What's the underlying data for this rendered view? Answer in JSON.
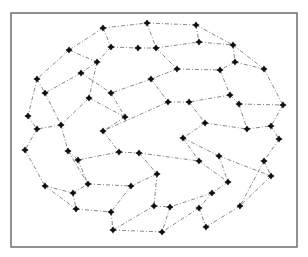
{
  "figure": {
    "frame": {
      "x": 11,
      "y": 13,
      "width": 286,
      "height": 234
    },
    "colors": {
      "frame": "#6e6e6e",
      "edge": "#7a7a7a",
      "node": "#111111",
      "background": "#ffffff"
    },
    "nodes": [
      [
        103,
        28
      ],
      [
        147,
        23
      ],
      [
        196,
        25
      ],
      [
        69,
        50
      ],
      [
        111,
        47
      ],
      [
        138,
        48
      ],
      [
        156,
        48
      ],
      [
        199,
        42
      ],
      [
        233,
        45
      ],
      [
        97,
        62
      ],
      [
        235,
        62
      ],
      [
        177,
        69
      ],
      [
        220,
        70
      ],
      [
        264,
        69
      ],
      [
        81,
        73
      ],
      [
        37,
        79
      ],
      [
        151,
        79
      ],
      [
        45,
        93
      ],
      [
        111,
        93
      ],
      [
        89,
        98
      ],
      [
        230,
        95
      ],
      [
        168,
        102
      ],
      [
        189,
        102
      ],
      [
        239,
        104
      ],
      [
        283,
        105
      ],
      [
        28,
        116
      ],
      [
        61,
        125
      ],
      [
        125,
        117
      ],
      [
        37,
        129
      ],
      [
        103,
        131
      ],
      [
        205,
        123
      ],
      [
        247,
        129
      ],
      [
        271,
        126
      ],
      [
        183,
        138
      ],
      [
        279,
        139
      ],
      [
        25,
        150
      ],
      [
        68,
        151
      ],
      [
        119,
        152
      ],
      [
        139,
        153
      ],
      [
        219,
        156
      ],
      [
        199,
        161
      ],
      [
        264,
        161
      ],
      [
        78,
        160
      ],
      [
        157,
        174
      ],
      [
        271,
        176
      ],
      [
        228,
        182
      ],
      [
        45,
        186
      ],
      [
        88,
        184
      ],
      [
        131,
        186
      ],
      [
        73,
        193
      ],
      [
        212,
        193
      ],
      [
        154,
        206
      ],
      [
        170,
        207
      ],
      [
        199,
        208
      ],
      [
        240,
        206
      ],
      [
        76,
        209
      ],
      [
        111,
        212
      ],
      [
        113,
        230
      ],
      [
        162,
        232
      ],
      [
        206,
        227
      ]
    ],
    "edges": [
      [
        0,
        1
      ],
      [
        1,
        2
      ],
      [
        0,
        3
      ],
      [
        0,
        4
      ],
      [
        4,
        5
      ],
      [
        5,
        6
      ],
      [
        1,
        6
      ],
      [
        6,
        7
      ],
      [
        2,
        7
      ],
      [
        2,
        8
      ],
      [
        7,
        8
      ],
      [
        3,
        9
      ],
      [
        4,
        9
      ],
      [
        8,
        10
      ],
      [
        8,
        13
      ],
      [
        10,
        12
      ],
      [
        10,
        13
      ],
      [
        11,
        12
      ],
      [
        6,
        11
      ],
      [
        11,
        16
      ],
      [
        3,
        15
      ],
      [
        9,
        19
      ],
      [
        9,
        14
      ],
      [
        14,
        17
      ],
      [
        14,
        18
      ],
      [
        15,
        17
      ],
      [
        15,
        25
      ],
      [
        16,
        18
      ],
      [
        16,
        21
      ],
      [
        12,
        20
      ],
      [
        20,
        22
      ],
      [
        20,
        23
      ],
      [
        21,
        22
      ],
      [
        13,
        24
      ],
      [
        23,
        24
      ],
      [
        17,
        26
      ],
      [
        19,
        26
      ],
      [
        18,
        27
      ],
      [
        19,
        27
      ],
      [
        25,
        28
      ],
      [
        26,
        28
      ],
      [
        27,
        29
      ],
      [
        21,
        29
      ],
      [
        22,
        30
      ],
      [
        23,
        31
      ],
      [
        24,
        32
      ],
      [
        31,
        32
      ],
      [
        30,
        31
      ],
      [
        30,
        33
      ],
      [
        29,
        37
      ],
      [
        32,
        34
      ],
      [
        34,
        41
      ],
      [
        33,
        39
      ],
      [
        33,
        40
      ],
      [
        39,
        44
      ],
      [
        41,
        44
      ],
      [
        28,
        35
      ],
      [
        26,
        36
      ],
      [
        36,
        42
      ],
      [
        35,
        46
      ],
      [
        36,
        47
      ],
      [
        37,
        38
      ],
      [
        38,
        40
      ],
      [
        37,
        42
      ],
      [
        38,
        43
      ],
      [
        43,
        48
      ],
      [
        47,
        48
      ],
      [
        42,
        47
      ],
      [
        46,
        49
      ],
      [
        49,
        47
      ],
      [
        46,
        55
      ],
      [
        49,
        55
      ],
      [
        40,
        45
      ],
      [
        45,
        50
      ],
      [
        39,
        45
      ],
      [
        44,
        54
      ],
      [
        43,
        51
      ],
      [
        50,
        52
      ],
      [
        50,
        53
      ],
      [
        51,
        52
      ],
      [
        52,
        58
      ],
      [
        48,
        56
      ],
      [
        55,
        56
      ],
      [
        56,
        57
      ],
      [
        57,
        58
      ],
      [
        53,
        59
      ],
      [
        54,
        59
      ],
      [
        41,
        54
      ],
      [
        57,
        51
      ],
      [
        53,
        58
      ]
    ]
  }
}
